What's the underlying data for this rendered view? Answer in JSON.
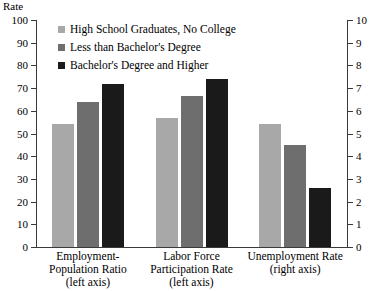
{
  "chart_data": {
    "type": "bar",
    "title": "",
    "subtitle": "",
    "ylabel": "Rate",
    "xlabel": "",
    "grid": false,
    "legend_position": "top-left-inside",
    "categories": [
      "Employment-Population Ratio (left axis)",
      "Labor Force Participation Rate (left axis)",
      "Unemployment Rate (right axis)"
    ],
    "series": [
      {
        "name": "High School Graduates, No College",
        "color": "#a8a8a8",
        "values": [
          54,
          57,
          5.4
        ]
      },
      {
        "name": "Less than Bachelor's Degree",
        "color": "#6e6e6e",
        "values": [
          64,
          66.5,
          4.5
        ]
      },
      {
        "name": "Bachelor's Degree and Higher",
        "color": "#1a1a1a",
        "values": [
          72,
          74,
          2.6
        ]
      }
    ],
    "axes": {
      "left": {
        "label": "Rate",
        "min": 0,
        "max": 100,
        "step": 10,
        "ticks": [
          0,
          10,
          20,
          30,
          40,
          50,
          60,
          70,
          80,
          90,
          100
        ],
        "applies_to_categories": [
          0,
          1
        ]
      },
      "right": {
        "label": "",
        "min": 0,
        "max": 10,
        "step": 1,
        "ticks": [
          0,
          1,
          2,
          3,
          4,
          5,
          6,
          7,
          8,
          9,
          10
        ],
        "applies_to_categories": [
          2
        ]
      }
    }
  },
  "axis_left": {
    "title": "Rate",
    "tick_labels": [
      "100",
      "90",
      "80",
      "70",
      "60",
      "50",
      "40",
      "30",
      "20",
      "10",
      "0"
    ]
  },
  "axis_right": {
    "tick_labels": [
      "10",
      "9",
      "8",
      "7",
      "6",
      "5",
      "4",
      "3",
      "2",
      "1",
      "0"
    ]
  },
  "legend": {
    "items": [
      {
        "label": "High School Graduates, No College",
        "color": "#a8a8a8"
      },
      {
        "label": "Less than Bachelor's Degree",
        "color": "#6e6e6e"
      },
      {
        "label": "Bachelor's Degree and Higher",
        "color": "#1a1a1a"
      }
    ]
  },
  "category_labels": [
    {
      "line1": "Employment-",
      "line2": "Population Ratio",
      "line3": "(left axis)"
    },
    {
      "line1": "Labor Force",
      "line2": "Participation Rate",
      "line3": "(left axis)"
    },
    {
      "line1": "Unemployment Rate",
      "line2": "(right axis)",
      "line3": ""
    }
  ]
}
